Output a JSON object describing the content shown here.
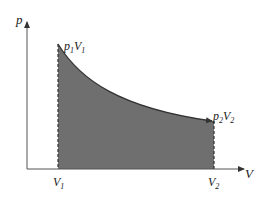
{
  "diagram": {
    "type": "pV-diagram",
    "axes": {
      "y_label": "p",
      "x_label": "V"
    },
    "points": {
      "start": {
        "p_label": "p",
        "p_sub": "1",
        "v_label": "V",
        "v_sub": "1"
      },
      "end": {
        "p_label": "p",
        "p_sub": "2",
        "v_label": "V",
        "v_sub": "2"
      }
    },
    "ticks": {
      "v1": {
        "label": "V",
        "sub": "1"
      },
      "v2": {
        "label": "V",
        "sub": "2"
      }
    },
    "colors": {
      "fill": "#6f6f6f",
      "line": "#333333",
      "axis": "#555555"
    }
  }
}
